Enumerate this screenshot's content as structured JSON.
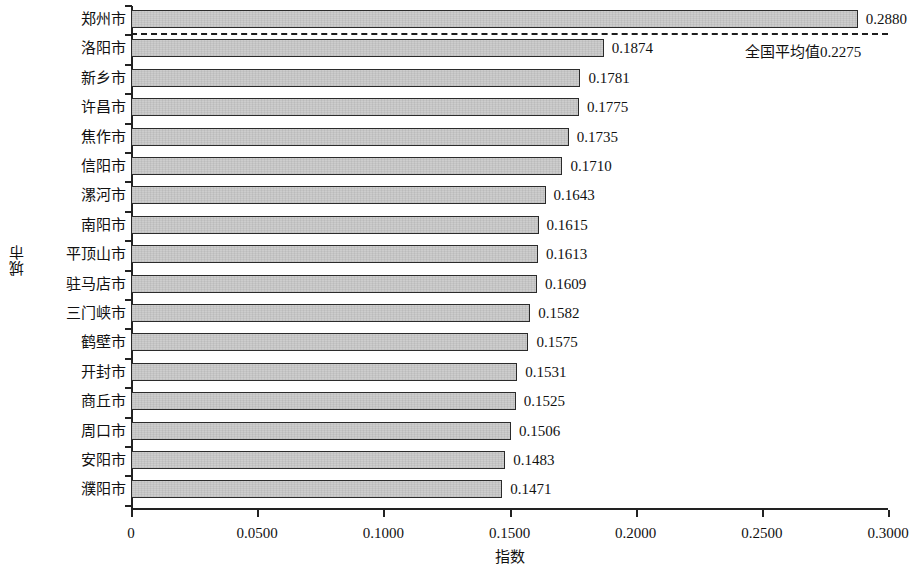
{
  "chart_data": {
    "type": "bar",
    "orientation": "horizontal",
    "title": "",
    "xlabel": "指数",
    "ylabel": "城市",
    "categories": [
      "郑州市",
      "洛阳市",
      "新乡市",
      "许昌市",
      "焦作市",
      "信阳市",
      "漯河市",
      "南阳市",
      "平顶山市",
      "驻马店市",
      "三门峡市",
      "鹤壁市",
      "开封市",
      "商丘市",
      "周口市",
      "安阳市",
      "濮阳市"
    ],
    "values": [
      0.288,
      0.1874,
      0.1781,
      0.1775,
      0.1735,
      0.171,
      0.1643,
      0.1615,
      0.1613,
      0.1609,
      0.1582,
      0.1575,
      0.1531,
      0.1525,
      0.1506,
      0.1483,
      0.1471
    ],
    "value_labels": [
      "0.2880",
      "0.1874",
      "0.1781",
      "0.1775",
      "0.1735",
      "0.1710",
      "0.1643",
      "0.1615",
      "0.1613",
      "0.1609",
      "0.1582",
      "0.1575",
      "0.1531",
      "0.1525",
      "0.1506",
      "0.1483",
      "0.1471"
    ],
    "xlim": [
      0,
      0.3
    ],
    "xticks": [
      0,
      0.05,
      0.1,
      0.15,
      0.2,
      0.25,
      0.3
    ],
    "xtick_labels": [
      "0",
      "0.0500",
      "0.1000",
      "0.1500",
      "0.2000",
      "0.2500",
      "0.3000"
    ],
    "grid": false,
    "legend": "none",
    "reference_line": {
      "value": 0.2275,
      "label": "全国平均值0.2275",
      "style": "dashed",
      "color": "#1d1d1d"
    },
    "bar_fill_color": "#cdcdcd",
    "bar_border_color": "#2b2b2b"
  }
}
